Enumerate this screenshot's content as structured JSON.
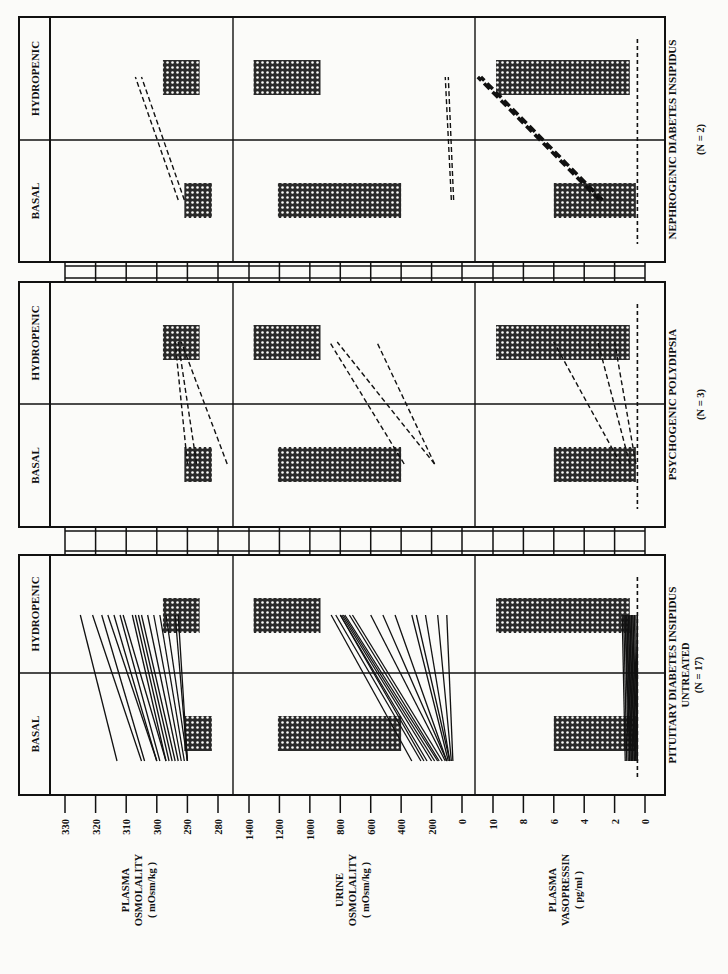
{
  "chart_data": {
    "type": "line",
    "orientation_note": "figure printed rotated 90 degrees counter-clockwise; value axes run along the bottom edge",
    "phases": [
      "BASAL",
      "HYDROPENIC"
    ],
    "axes": [
      {
        "id": "plasma_osm",
        "label_lines": [
          "PLASMA",
          "OSMOLALITY",
          "( mOsm/kg )"
        ],
        "ticks": [
          330,
          320,
          310,
          300,
          290,
          280
        ],
        "range": [
          330,
          280
        ],
        "normal_range": {
          "basal": [
            282,
            291
          ],
          "hydropenic": [
            286,
            298
          ]
        }
      },
      {
        "id": "urine_osm",
        "label_lines": [
          "URINE",
          "OSMOLALITY",
          "( mOsm/kg )"
        ],
        "ticks": [
          1400,
          1200,
          1000,
          800,
          600,
          400,
          200,
          0
        ],
        "range": [
          1400,
          0
        ],
        "normal_range": {
          "basal": [
            400,
            1210
          ],
          "hydropenic": [
            930,
            1370
          ]
        }
      },
      {
        "id": "plasma_avp",
        "label_lines": [
          "PLASMA",
          "VASOPRESSIN",
          "( pg/ml )"
        ],
        "ticks": [
          10,
          8,
          6,
          4,
          2,
          0
        ],
        "range": [
          10,
          0
        ],
        "normal_range": {
          "basal": [
            0.6,
            6.0
          ],
          "hydropenic": [
            1.0,
            9.8
          ]
        },
        "detection_limit": 0.5
      }
    ],
    "groups": [
      {
        "title": "NEPHROGENIC DIABETES INSIPIDUS",
        "subtitle": "",
        "n_label": "(N = 2)",
        "line_style": "dashed",
        "series": {
          "plasma_osm": [
            {
              "basal": 291,
              "hydropenic": 305
            },
            {
              "basal": 293,
              "hydropenic": 307
            }
          ],
          "urine_osm": [
            {
              "basal": 70,
              "hydropenic": 110
            },
            {
              "basal": 55,
              "hydropenic": 90
            }
          ],
          "plasma_avp": [
            {
              "basal": 3.0,
              "hydropenic": 11.0
            },
            {
              "basal": 2.8,
              "hydropenic": 10.8
            }
          ]
        }
      },
      {
        "title": "PSYCHOGENIC POLYDIPSIA",
        "subtitle": "",
        "n_label": "(N = 3)",
        "line_style": "dashed",
        "series": {
          "plasma_osm": [
            {
              "basal": 290,
              "hydropenic": 294
            },
            {
              "basal": 287,
              "hydropenic": 293
            },
            {
              "basal": 277,
              "hydropenic": 292
            }
          ],
          "urine_osm": [
            {
              "basal": 380,
              "hydropenic": 870
            },
            {
              "basal": 180,
              "hydropenic": 820
            },
            {
              "basal": 180,
              "hydropenic": 560
            }
          ],
          "plasma_avp": [
            {
              "basal": 1.6,
              "hydropenic": 6.0
            },
            {
              "basal": 1.0,
              "hydropenic": 3.1
            },
            {
              "basal": 0.6,
              "hydropenic": 2.0
            }
          ]
        }
      },
      {
        "title": "PITUITARY DIABETES INSIPIDUS",
        "subtitle": "UNTREATED",
        "n_label": "(N = 17)",
        "line_style": "solid",
        "series": {
          "plasma_osm": [
            {
              "basal": 313,
              "hydropenic": 325
            },
            {
              "basal": 305,
              "hydropenic": 321
            },
            {
              "basal": 304,
              "hydropenic": 318
            },
            {
              "basal": 300,
              "hydropenic": 316
            },
            {
              "basal": 300,
              "hydropenic": 314
            },
            {
              "basal": 299,
              "hydropenic": 312
            },
            {
              "basal": 297,
              "hydropenic": 311
            },
            {
              "basal": 297,
              "hydropenic": 308
            },
            {
              "basal": 296,
              "hydropenic": 307
            },
            {
              "basal": 295,
              "hydropenic": 306
            },
            {
              "basal": 294,
              "hydropenic": 305
            },
            {
              "basal": 293,
              "hydropenic": 303
            },
            {
              "basal": 292,
              "hydropenic": 301
            },
            {
              "basal": 291,
              "hydropenic": 299
            },
            {
              "basal": 290,
              "hydropenic": 297
            },
            {
              "basal": 290,
              "hydropenic": 294
            },
            {
              "basal": 290,
              "hydropenic": 293
            }
          ],
          "urine_osm": [
            {
              "basal": 330,
              "hydropenic": 860
            },
            {
              "basal": 270,
              "hydropenic": 830
            },
            {
              "basal": 250,
              "hydropenic": 800
            },
            {
              "basal": 230,
              "hydropenic": 800
            },
            {
              "basal": 200,
              "hydropenic": 790
            },
            {
              "basal": 180,
              "hydropenic": 780
            },
            {
              "basal": 160,
              "hydropenic": 770
            },
            {
              "basal": 150,
              "hydropenic": 740
            },
            {
              "basal": 130,
              "hydropenic": 720
            },
            {
              "basal": 110,
              "hydropenic": 600
            },
            {
              "basal": 100,
              "hydropenic": 520
            },
            {
              "basal": 100,
              "hydropenic": 440
            },
            {
              "basal": 90,
              "hydropenic": 330
            },
            {
              "basal": 80,
              "hydropenic": 300
            },
            {
              "basal": 80,
              "hydropenic": 240
            },
            {
              "basal": 70,
              "hydropenic": 160
            },
            {
              "basal": 60,
              "hydropenic": 100
            }
          ],
          "plasma_avp": [
            {
              "basal": 1.3,
              "hydropenic": 1.5
            },
            {
              "basal": 1.2,
              "hydropenic": 1.4
            },
            {
              "basal": 1.1,
              "hydropenic": 1.3
            },
            {
              "basal": 1.0,
              "hydropenic": 1.3
            },
            {
              "basal": 1.0,
              "hydropenic": 1.2
            },
            {
              "basal": 0.9,
              "hydropenic": 1.2
            },
            {
              "basal": 0.9,
              "hydropenic": 1.1
            },
            {
              "basal": 0.8,
              "hydropenic": 1.1
            },
            {
              "basal": 0.8,
              "hydropenic": 1.0
            },
            {
              "basal": 0.7,
              "hydropenic": 1.0
            },
            {
              "basal": 0.7,
              "hydropenic": 0.9
            },
            {
              "basal": 0.6,
              "hydropenic": 0.9
            },
            {
              "basal": 0.6,
              "hydropenic": 0.8
            },
            {
              "basal": 0.5,
              "hydropenic": 0.8
            },
            {
              "basal": 0.5,
              "hydropenic": 0.7
            },
            {
              "basal": 0.5,
              "hydropenic": 0.6
            },
            {
              "basal": 0.5,
              "hydropenic": 0.5
            }
          ]
        }
      }
    ],
    "legend": {
      "hatched_bar": "normal range",
      "solid_line": "individual patient (pituitary DI)",
      "dashed_line": "individual patient (nephrogenic DI / psychogenic polydipsia)",
      "vertical_dashed_line": "assay detection limit"
    },
    "grid": false
  },
  "layout": {
    "group_boxes_y": [
      [
        17,
        262
      ],
      [
        282,
        527
      ],
      [
        555,
        795
      ]
    ],
    "phase_divider_y": [
      140,
      404,
      673
    ],
    "box_x": [
      19,
      665
    ],
    "label_col_x": [
      19,
      50
    ],
    "panel_x": [
      [
        50,
        233
      ],
      [
        233,
        475
      ],
      [
        475,
        665
      ]
    ],
    "tick_px": {
      "plasma_osm": [
        65,
        218
      ],
      "urine_osm": [
        249,
        462
      ],
      "plasma_avp": [
        493,
        645
      ]
    },
    "hatch_color": "#2a2a2a",
    "line_color": "#111111",
    "paper_color": "#fbfbf9"
  }
}
